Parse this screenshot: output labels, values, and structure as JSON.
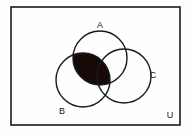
{
  "figure": {
    "kind": "venn-diagram",
    "background_color": "#fefefe",
    "stroke_color": "#1a1a1a",
    "shade_color": "#150a08"
  },
  "universe": {
    "label": "U",
    "label_x": 170,
    "label_y": 116,
    "rect": {
      "x": 11,
      "y": 7,
      "width": 169,
      "height": 118
    },
    "border_width": 1.6
  },
  "sets": [
    {
      "id": "A",
      "label": "A",
      "label_x": 100,
      "label_y": 26,
      "circle": {
        "cx": 100,
        "cy": 58,
        "r": 27
      },
      "stroke_width": 1.4
    },
    {
      "id": "B",
      "label": "B",
      "label_x": 62,
      "label_y": 112,
      "circle": {
        "cx": 83,
        "cy": 80,
        "r": 27
      },
      "stroke_width": 1.4
    },
    {
      "id": "C",
      "label": "C",
      "label_x": 153,
      "label_y": 76,
      "circle": {
        "cx": 124,
        "cy": 76,
        "r": 27
      },
      "stroke_width": 1.4
    }
  ],
  "shaded_region": {
    "name": "A-intersect-B",
    "expression": "A ∩ B",
    "fill": "#150a08",
    "includes_triple_intersection": true
  }
}
